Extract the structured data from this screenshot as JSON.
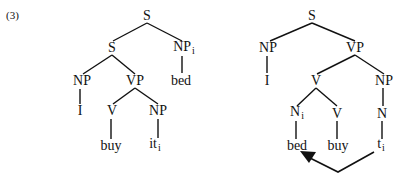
{
  "example_number": "(3)",
  "left_tree": {
    "root": "S",
    "s_inner": "S",
    "np_topic": "NP",
    "np_topic_index": "i",
    "topic_word": "bed",
    "np_subject": "NP",
    "subject_word": "I",
    "vp": "VP",
    "verb": "V",
    "verb_word": "buy",
    "np_object": "NP",
    "object_word": "it",
    "object_index": "i"
  },
  "right_tree": {
    "root": "S",
    "np_subject": "NP",
    "subject_word": "I",
    "vp": "VP",
    "verb_complex": "V",
    "noun_incorporated": "N",
    "noun_index": "i",
    "noun_word": "bed",
    "verb": "V",
    "verb_word": "buy",
    "np_object": "NP",
    "n_object": "N",
    "trace": "t",
    "trace_index": "i"
  },
  "colors": {
    "line": "#111111",
    "text": "#111111",
    "background": "#ffffff"
  }
}
